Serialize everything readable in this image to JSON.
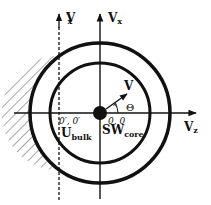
{
  "diagram": {
    "center": {
      "x": 100,
      "y": 113
    },
    "outer_radius": 70,
    "inner_radius": 50,
    "core_radius": 7,
    "colors": {
      "stroke": "#111111",
      "background": "#ffffff"
    },
    "axes": {
      "vx": {
        "label": "V",
        "subscript": "x"
      },
      "vx_prime": {
        "label": "V",
        "prime": "′",
        "subscript": "x"
      },
      "vz": {
        "label": "V",
        "subscript": "z"
      }
    },
    "vector": {
      "label": "V",
      "angle_label": "Θ"
    },
    "labels": {
      "origin_prime": "0′, 0′",
      "origin": "0, 0",
      "u_bulk": "U",
      "u_bulk_sub": "bulk",
      "sw_core": "SW",
      "sw_core_sub": "core"
    }
  }
}
